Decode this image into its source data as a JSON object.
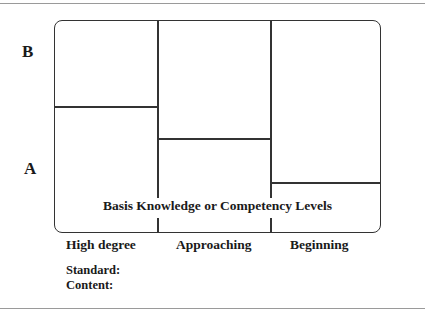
{
  "diagram": {
    "y_labels": {
      "top": "B",
      "bottom": "A"
    },
    "center_label": "Basis Knowledge or Competency Levels",
    "columns": [
      {
        "label": "High degree",
        "divider_y": 107
      },
      {
        "label": "Approaching",
        "divider_y": 139
      },
      {
        "label": "Beginning",
        "divider_y": 183
      }
    ],
    "footer": {
      "standard_label": "Standard:",
      "content_label": "Content:"
    },
    "colors": {
      "line": "#333333",
      "rule": "#9a9a9a",
      "background": "#ffffff"
    }
  }
}
